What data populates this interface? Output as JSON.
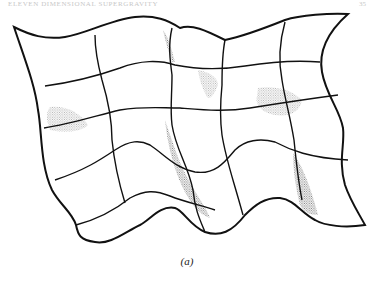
{
  "page": {
    "running_head": "ELEVEN DIMENSIONAL SUPERGRAVITY",
    "page_number": "35"
  },
  "figure": {
    "caption": "(a)",
    "colors": {
      "line": "#111111",
      "stipple": "#777777",
      "background": "#ffffff"
    }
  }
}
